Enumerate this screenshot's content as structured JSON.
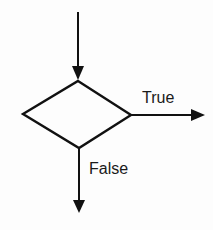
{
  "diagram": {
    "type": "flowchart-decision",
    "nodes": [
      {
        "id": "decision",
        "shape": "diamond",
        "label": ""
      }
    ],
    "edges": [
      {
        "id": "incoming",
        "direction": "down",
        "target": "decision",
        "label": ""
      },
      {
        "id": "true-branch",
        "direction": "right",
        "source": "decision",
        "label": "True"
      },
      {
        "id": "false-branch",
        "direction": "down",
        "source": "decision",
        "label": "False"
      }
    ],
    "labels": {
      "true": "True",
      "false": "False"
    },
    "colors": {
      "stroke": "#111111",
      "background": "#fdfdfd",
      "text": "#1a1a1a"
    }
  }
}
